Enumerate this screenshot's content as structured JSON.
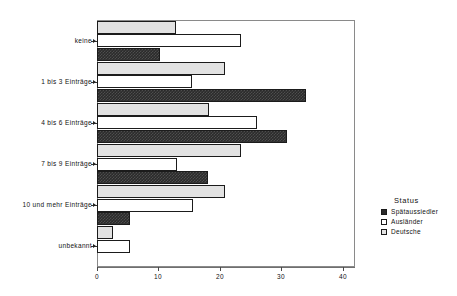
{
  "chart_data": {
    "type": "bar",
    "orientation": "horizontal",
    "title": "",
    "xlabel": "",
    "ylabel": "",
    "categories": [
      "keine",
      "1 bis 3 Einträge",
      "4 bis 6 Einträge",
      "7 bis 9 Einträge",
      "10 und mehr Einträge",
      "unbekannt"
    ],
    "series": [
      {
        "name": "Spätaussiedler",
        "color": "#2b2b2b",
        "values": [
          10.3,
          34.0,
          31.0,
          18.0,
          5.3,
          0.0
        ]
      },
      {
        "name": "Ausländer",
        "color": "#ffffff",
        "values": [
          23.5,
          15.5,
          26.0,
          13.0,
          15.6,
          5.3
        ]
      },
      {
        "name": "Deutsche",
        "color": "#e2e2e2",
        "values": [
          12.8,
          20.8,
          18.2,
          23.4,
          20.8,
          2.6
        ]
      }
    ],
    "xlim": [
      0,
      42
    ],
    "xticks": [
      0,
      10,
      20,
      30,
      40
    ],
    "xtick_labels": [
      "0",
      "10",
      "20",
      "30",
      "40"
    ],
    "grid": false,
    "legend": {
      "title": "Status",
      "position": "right",
      "entries": [
        "Spätaussiedler",
        "Ausländer",
        "Deutsche"
      ]
    }
  },
  "legend": {
    "title": "Status",
    "items": [
      {
        "label": "Spätaussiedler"
      },
      {
        "label": "Ausländer"
      },
      {
        "label": "Deutsche"
      }
    ]
  },
  "axis": {
    "x_tick_labels": [
      "0",
      "10",
      "20",
      "30",
      "40"
    ],
    "y_category_labels": [
      "keine",
      "1 bis 3 Einträge",
      "4 bis 6 Einträge",
      "7 bis 9 Einträge",
      "10 und mehr Einträge",
      "unbekannt"
    ]
  }
}
